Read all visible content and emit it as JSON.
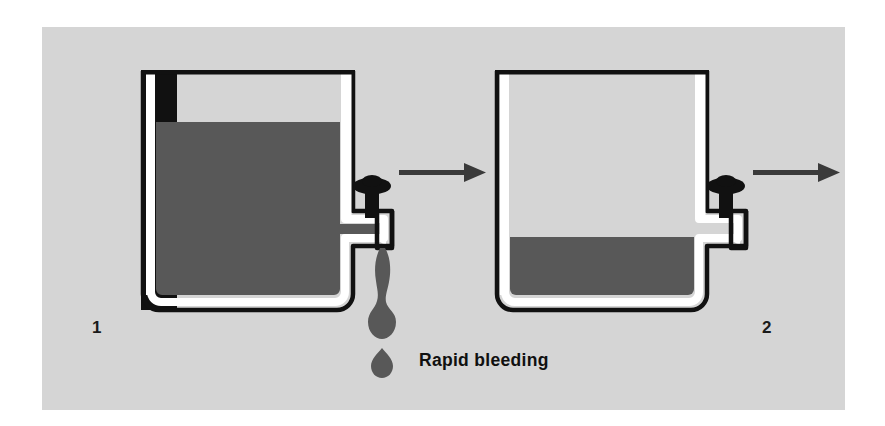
{
  "figure": {
    "background_color": "#ffffff",
    "panel_color": "#d5d5d5",
    "liquid_color": "#585858",
    "line_color": "#111111",
    "vessel_fill_color": "#ffffff"
  },
  "caption": {
    "text": "Rapid bleeding"
  },
  "steps": [
    {
      "number": "1",
      "label": "1",
      "tank": {
        "name": "tank-full",
        "fill_level_percent": 80,
        "liquid_state": "nearly full",
        "valve_state": "open",
        "outlet": "dripping"
      },
      "drip": {
        "name": "liquid-drip",
        "visible": true,
        "drops": 2
      }
    },
    {
      "number": "2",
      "label": "2",
      "tank": {
        "name": "tank-partial",
        "fill_level_percent": 32,
        "liquid_state": "partially drained",
        "valve_state": "open",
        "outlet": "empty"
      },
      "drip": {
        "name": "liquid-drip",
        "visible": false,
        "drops": 0
      }
    }
  ],
  "arrows": [
    {
      "name": "arrow-step-1-to-2",
      "direction": "right"
    },
    {
      "name": "arrow-step-2-to-next",
      "direction": "right"
    }
  ],
  "icons": {
    "valve_handle": "valve-knob-icon",
    "arrow": "arrow-right-icon"
  }
}
